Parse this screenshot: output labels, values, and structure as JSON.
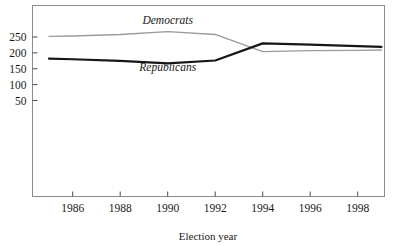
{
  "chart_data": {
    "type": "line",
    "title": "",
    "xlabel": "Election year",
    "ylabel": "",
    "x": [
      1985,
      1986,
      1988,
      1990,
      1992,
      1994,
      1996,
      1998,
      1999
    ],
    "xtick_labels": [
      "1986",
      "1988",
      "1990",
      "1992",
      "1994",
      "1996",
      "1998"
    ],
    "xticks": [
      1986,
      1988,
      1990,
      1992,
      1994,
      1996,
      1998
    ],
    "ytick_labels": [
      "50",
      "100",
      "150",
      "200",
      "250"
    ],
    "yticks": [
      50,
      100,
      150,
      200,
      250
    ],
    "xlim": [
      1985,
      1999
    ],
    "ylim": [
      0,
      310
    ],
    "grid": false,
    "legend": "inline-annotations",
    "series": [
      {
        "name": "Democrats",
        "color": "#9b9b9b",
        "label_text": "Democrats",
        "values": [
          252,
          253,
          258,
          267,
          258,
          204,
          207,
          208,
          209
        ],
        "points": [
          {
            "year": 1985,
            "seats": 252
          },
          {
            "year": 1986,
            "seats": 253
          },
          {
            "year": 1988,
            "seats": 258
          },
          {
            "year": 1990,
            "seats": 267
          },
          {
            "year": 1992,
            "seats": 258
          },
          {
            "year": 1994,
            "seats": 204
          },
          {
            "year": 1996,
            "seats": 207
          },
          {
            "year": 1998,
            "seats": 208
          },
          {
            "year": 1999,
            "seats": 209
          }
        ]
      },
      {
        "name": "Republicans",
        "color": "#161616",
        "label_text": "Republicans",
        "values": [
          182,
          180,
          175,
          167,
          176,
          230,
          226,
          221,
          219
        ],
        "points": [
          {
            "year": 1985,
            "seats": 182
          },
          {
            "year": 1986,
            "seats": 180
          },
          {
            "year": 1988,
            "seats": 175
          },
          {
            "year": 1990,
            "seats": 167
          },
          {
            "year": 1992,
            "seats": 176
          },
          {
            "year": 1994,
            "seats": 230
          },
          {
            "year": 1996,
            "seats": 226
          },
          {
            "year": 1998,
            "seats": 221
          },
          {
            "year": 1999,
            "seats": 219
          }
        ]
      }
    ],
    "annotations": [
      {
        "text": "Democrats",
        "x": 1990,
        "y": 290
      },
      {
        "text": "Republicans",
        "x": 1990,
        "y": 143
      }
    ]
  },
  "axis": {
    "x_title": "Election year",
    "frame_color": "#8a8a8a"
  }
}
